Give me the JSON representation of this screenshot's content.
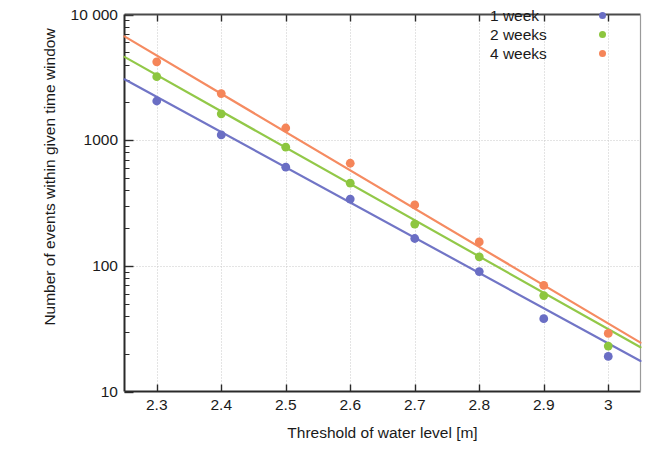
{
  "chart_data": {
    "type": "scatter",
    "title": "",
    "xlabel": "Threshold of water level [m]",
    "ylabel": "Number of events within given time window",
    "xlim": [
      2.25,
      3.05
    ],
    "ylim": [
      10,
      10000
    ],
    "yscale": "log",
    "grid": true,
    "legend_position": "top-right",
    "x": [
      2.3,
      2.4,
      2.5,
      2.6,
      2.7,
      2.8,
      2.9,
      3.0
    ],
    "xticks": [
      "2.3",
      "2.4",
      "2.5",
      "2.6",
      "2.7",
      "2.8",
      "2.9",
      "3"
    ],
    "yticks": [
      "10 000",
      "1000",
      "100",
      "10"
    ],
    "ytick_values": [
      10000,
      1000,
      100,
      10
    ],
    "series": [
      {
        "name": "1 week",
        "color": "#6a6ec4",
        "values": [
          2050,
          1100,
          610,
          340,
          165,
          90,
          38,
          19
        ],
        "fit_start": 3050,
        "fit_end": 17.5
      },
      {
        "name": "2 weeks",
        "color": "#8dc63f",
        "values": [
          3200,
          1620,
          880,
          455,
          215,
          118,
          58,
          23
        ],
        "fit_start": 4600,
        "fit_end": 22.5
      },
      {
        "name": "4 weeks",
        "color": "#f58559",
        "values": [
          4200,
          2350,
          1250,
          655,
          305,
          155,
          70,
          29
        ],
        "fit_start": 6700,
        "fit_end": 24.5
      }
    ]
  },
  "legend": {
    "items": [
      {
        "label": "1 week",
        "color": "#6a6ec4"
      },
      {
        "label": "2 weeks",
        "color": "#8dc63f"
      },
      {
        "label": "4 weeks",
        "color": "#f58559"
      }
    ]
  },
  "axes": {
    "x_label": "Threshold of water level [m]",
    "y_label": "Number of events within given time window",
    "x_ticks": [
      "2.3",
      "2.4",
      "2.5",
      "2.6",
      "2.7",
      "2.8",
      "2.9",
      "3"
    ],
    "y_ticks": [
      "10 000",
      "1000",
      "100",
      "10"
    ]
  }
}
